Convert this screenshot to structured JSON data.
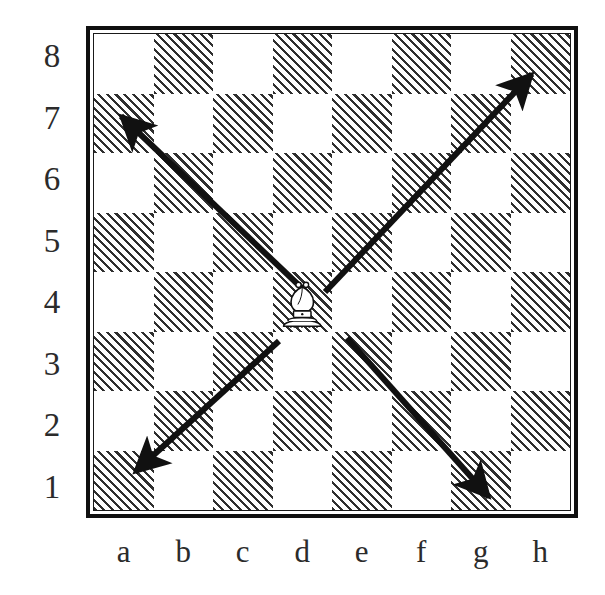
{
  "diagram": {
    "type": "chess-board-diagram",
    "board": {
      "files": [
        "a",
        "b",
        "c",
        "d",
        "e",
        "f",
        "g",
        "h"
      ],
      "ranks": [
        "8",
        "7",
        "6",
        "5",
        "4",
        "3",
        "2",
        "1"
      ],
      "light_square_color": "#ffffff",
      "dark_square_fill": "hatched-diagonal",
      "dark_square_line_color": "#2f2f2f",
      "border_color": "#101010",
      "a8_is_light": true
    },
    "pieces": [
      {
        "piece": "bishop",
        "color": "white",
        "square": "d4",
        "file_index": 3,
        "rank_index": 4
      }
    ],
    "arrows": [
      {
        "name": "arrow-up-left",
        "from_square": "d4",
        "to_square": "a7",
        "direction": "up-left",
        "from": [
          307,
          293
        ],
        "to": [
          121,
          116
        ]
      },
      {
        "name": "arrow-up-right",
        "from_square": "d4",
        "to_square": "h8",
        "direction": "up-right",
        "from": [
          325,
          292
        ],
        "to": [
          532,
          74
        ]
      },
      {
        "name": "arrow-down-left",
        "from_square": "d4",
        "to_square": "a1",
        "direction": "down-left",
        "from": [
          279,
          341
        ],
        "to": [
          135,
          472
        ]
      },
      {
        "name": "arrow-down-right",
        "from_square": "d4",
        "to_square": "g1",
        "direction": "down-right",
        "from": [
          347,
          338
        ],
        "to": [
          489,
          497
        ]
      }
    ],
    "arrow_color": "#111111",
    "label_color": "#2b2b2b"
  },
  "chart_data": {
    "type": "diagram",
    "xlabel": "",
    "ylabel": "",
    "categories": [
      "a",
      "b",
      "c",
      "d",
      "e",
      "f",
      "g",
      "h"
    ],
    "values": [
      8,
      7,
      6,
      5,
      4,
      3,
      2,
      1
    ]
  }
}
